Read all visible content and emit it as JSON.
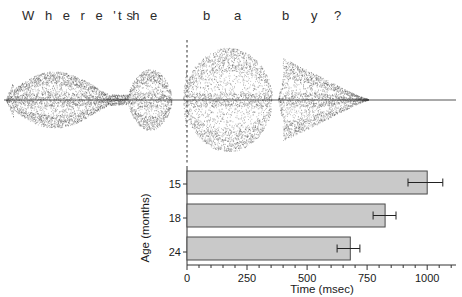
{
  "figure": {
    "utterance": {
      "full_text": "Where's the baby?",
      "tokens": [
        {
          "text": "W h e r e ' s",
          "x": 22
        },
        {
          "text": "t h e",
          "x": 115
        },
        {
          "text": "b",
          "x": 200
        },
        {
          "text": "a",
          "x": 232
        },
        {
          "text": "b",
          "x": 280
        },
        {
          "text": "y",
          "x": 310
        },
        {
          "text": "?",
          "x": 334
        }
      ]
    },
    "waveform": {
      "label": "speech-oscillogram",
      "baseline_y": 62,
      "start_x": 4,
      "end_x": 456,
      "target_onset_marker_x": 187,
      "segments": [
        {
          "name": "wheres",
          "start": 6,
          "end": 128,
          "peak": 34
        },
        {
          "name": "the",
          "start": 128,
          "end": 172,
          "peak": 34
        },
        {
          "name": "ba",
          "start": 183,
          "end": 272,
          "peak": 52
        },
        {
          "name": "by",
          "start": 278,
          "end": 370,
          "peak": 42
        },
        {
          "name": "silence-tail",
          "start": 370,
          "end": 456,
          "peak": 1
        }
      ]
    },
    "chart_data": {
      "type": "bar",
      "orientation": "horizontal",
      "title": "",
      "xlabel": "Time (msec)",
      "ylabel": "Age (months)",
      "categories": [
        "15",
        "18",
        "24"
      ],
      "values": [
        1000,
        825,
        680
      ],
      "errors_low": [
        80,
        50,
        55
      ],
      "errors_high": [
        65,
        45,
        40
      ],
      "xlim": [
        0,
        1120
      ],
      "xticks": [
        0,
        250,
        500,
        750,
        1000
      ],
      "xtick_labels": [
        "0",
        "250",
        "500",
        "750",
        "1000"
      ],
      "minor_tick_step": 50,
      "grid": false,
      "legend": null,
      "bar_fill": "#c9c9c9",
      "bar_stroke": "#4a4a4a",
      "series": [
        {
          "name": "mean latency",
          "values": [
            1000,
            825,
            680
          ]
        }
      ]
    }
  }
}
